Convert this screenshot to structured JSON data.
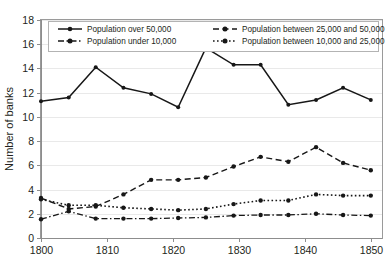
{
  "axes": {
    "ylabel": "Number of banks",
    "yticks": [
      "0",
      "2",
      "4",
      "6",
      "8",
      "10",
      "12",
      "14",
      "16",
      "18"
    ],
    "xticks": [
      "1800",
      "1810",
      "1820",
      "1830",
      "1840",
      "1850"
    ]
  },
  "legend": {
    "entries": [
      {
        "label": "Population over 50,000",
        "style": "solid"
      },
      {
        "label": "Population between 25,000 and 50,000",
        "style": "dashed"
      },
      {
        "label": "Population under 10,000",
        "style": "dashdot"
      },
      {
        "label": "Population between 10,000 and 25,000",
        "style": "dotted"
      }
    ]
  },
  "chart_data": {
    "type": "line",
    "title": "",
    "xlabel": "",
    "ylabel": "Number of banks",
    "xlim": [
      1800,
      1851.7
    ],
    "ylim": [
      0,
      18
    ],
    "ytick_step": 2,
    "grid": true,
    "legend_position": "top",
    "x": [
      1800,
      1804.2,
      1808.3,
      1812.5,
      1816.7,
      1820.8,
      1825,
      1829.2,
      1833.3,
      1837.5,
      1841.7,
      1845.8,
      1850
    ],
    "series": [
      {
        "name": "Population over 50,000",
        "style": "solid",
        "color": "#171717",
        "values": [
          11.3,
          11.6,
          14.1,
          12.4,
          11.9,
          10.8,
          15.7,
          14.3,
          14.3,
          11.0,
          11.4,
          12.4,
          11.4
        ]
      },
      {
        "name": "Population between 25,000 and 50,000",
        "style": "dashed",
        "color": "#171717",
        "values": [
          3.3,
          2.4,
          2.6,
          3.6,
          4.8,
          4.8,
          5.0,
          5.9,
          6.7,
          6.3,
          7.5,
          6.2,
          5.6
        ]
      },
      {
        "name": "Population between 10,000 and 25,000",
        "style": "dotted",
        "color": "#171717",
        "values": [
          3.2,
          2.7,
          2.7,
          2.5,
          2.4,
          2.3,
          2.4,
          2.8,
          3.1,
          3.1,
          3.6,
          3.5,
          3.5
        ]
      },
      {
        "name": "Population under 10,000",
        "style": "dashdot",
        "color": "#171717",
        "values": [
          1.55,
          2.2,
          1.6,
          1.6,
          1.6,
          1.65,
          1.7,
          1.85,
          1.9,
          1.9,
          2.0,
          1.9,
          1.85
        ]
      }
    ]
  }
}
